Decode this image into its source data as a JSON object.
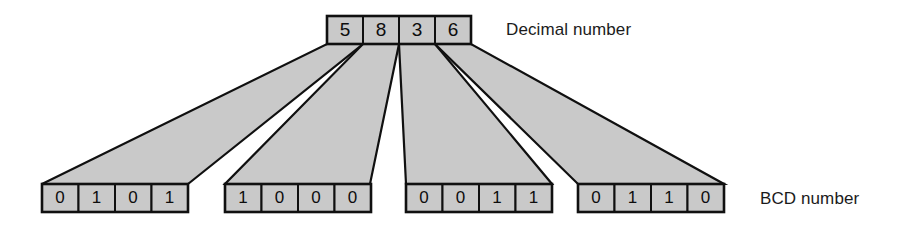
{
  "diagram": {
    "decimal_row": {
      "label": "Decimal number",
      "digits": [
        "5",
        "8",
        "3",
        "6"
      ]
    },
    "bcd_row": {
      "label": "BCD number",
      "groups": [
        {
          "decimal": "5",
          "bits": [
            "0",
            "1",
            "0",
            "1"
          ]
        },
        {
          "decimal": "8",
          "bits": [
            "1",
            "0",
            "0",
            "0"
          ]
        },
        {
          "decimal": "3",
          "bits": [
            "0",
            "0",
            "1",
            "1"
          ]
        },
        {
          "decimal": "6",
          "bits": [
            "0",
            "1",
            "1",
            "0"
          ]
        }
      ]
    },
    "colors": {
      "cell_fill": "#c9c9c9",
      "stroke": "#101010",
      "background": "#ffffff",
      "text": "#0d0d0d"
    }
  }
}
